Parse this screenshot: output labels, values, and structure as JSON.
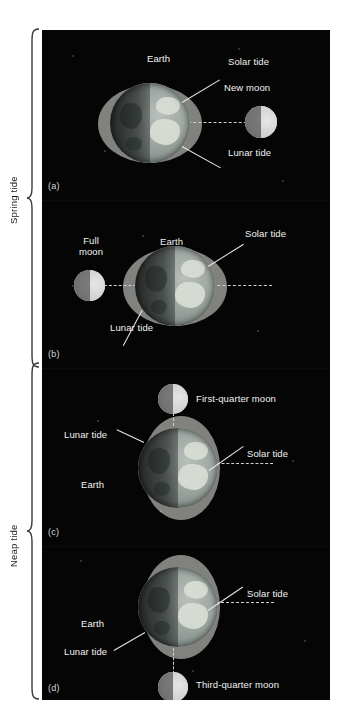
{
  "figure": {
    "groups": [
      {
        "id": "spring",
        "label": "Spring tide",
        "panels": [
          "a",
          "b"
        ]
      },
      {
        "id": "neap",
        "label": "Neap tide",
        "panels": [
          "c",
          "d"
        ]
      }
    ],
    "panels": [
      {
        "letter": "(a)",
        "configuration": "new-moon",
        "bodies": [
          {
            "name": "Earth",
            "label": "Earth"
          },
          {
            "name": "New moon",
            "label": "New moon"
          },
          {
            "name": "Sun",
            "label": ""
          }
        ],
        "annotations": [
          {
            "name": "solar-tide",
            "label": "Solar tide"
          },
          {
            "name": "lunar-tide",
            "label": "Lunar tide"
          }
        ]
      },
      {
        "letter": "(b)",
        "configuration": "full-moon",
        "bodies": [
          {
            "name": "Full moon",
            "label": "Full\nmoon"
          },
          {
            "name": "Earth",
            "label": "Earth"
          },
          {
            "name": "Sun",
            "label": ""
          }
        ],
        "annotations": [
          {
            "name": "solar-tide",
            "label": "Solar tide"
          },
          {
            "name": "lunar-tide",
            "label": "Lunar tide"
          }
        ]
      },
      {
        "letter": "(c)",
        "configuration": "first-quarter-moon",
        "bodies": [
          {
            "name": "First-quarter moon",
            "label": "First-quarter moon"
          },
          {
            "name": "Earth",
            "label": "Earth"
          },
          {
            "name": "Sun",
            "label": ""
          }
        ],
        "annotations": [
          {
            "name": "lunar-tide",
            "label": "Lunar tide"
          },
          {
            "name": "solar-tide",
            "label": "Solar tide"
          }
        ]
      },
      {
        "letter": "(d)",
        "configuration": "third-quarter-moon",
        "bodies": [
          {
            "name": "Third-quarter moon",
            "label": "Third-quarter moon"
          },
          {
            "name": "Earth",
            "label": "Earth"
          },
          {
            "name": "Sun",
            "label": ""
          }
        ],
        "annotations": [
          {
            "name": "solar-tide",
            "label": "Solar tide"
          },
          {
            "name": "lunar-tide",
            "label": "Lunar tide"
          }
        ]
      }
    ]
  },
  "labels": {
    "spring_tide": "Spring tide",
    "neap_tide": "Neap tide",
    "earth": "Earth",
    "new_moon": "New moon",
    "full_moon_line1": "Full",
    "full_moon_line2": "moon",
    "first_quarter_moon": "First-quarter moon",
    "third_quarter_moon": "Third-quarter moon",
    "solar_tide": "Solar tide",
    "lunar_tide": "Lunar tide",
    "panel_a": "(a)",
    "panel_b": "(b)",
    "panel_c": "(c)",
    "panel_d": "(d)"
  },
  "colors": {
    "background": "#ffffff",
    "sky": "#050505",
    "sun": "#b8b8b8",
    "moon": "#cfcfcf",
    "tide_bulge": "#cecec8",
    "annotation_text": "#f2f2f2",
    "group_label_text": "#1a1a1a",
    "dashed_line": "#cfcfcf"
  }
}
